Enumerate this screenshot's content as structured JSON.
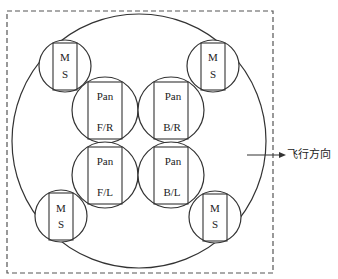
{
  "diagram": {
    "frame": {
      "x": 7,
      "y": 11,
      "width": 266,
      "height": 262,
      "style": "dashed"
    },
    "outer_circle": {
      "cx": 139,
      "cy": 141,
      "r": 127
    },
    "ms_units": [
      {
        "id": "ms-top-left",
        "cx": 65,
        "cy": 66,
        "r": 26,
        "rect": {
          "x": 53,
          "y": 43,
          "w": 24,
          "h": 47
        },
        "line1": "M",
        "line2": "S"
      },
      {
        "id": "ms-top-right",
        "cx": 213,
        "cy": 66,
        "r": 26,
        "rect": {
          "x": 201,
          "y": 43,
          "w": 24,
          "h": 47
        },
        "line1": "M",
        "line2": "S"
      },
      {
        "id": "ms-bottom-left",
        "cx": 61,
        "cy": 216,
        "r": 26,
        "rect": {
          "x": 49,
          "y": 193,
          "w": 24,
          "h": 47
        },
        "line1": "M",
        "line2": "S"
      },
      {
        "id": "ms-bottom-right",
        "cx": 215,
        "cy": 217,
        "r": 26,
        "rect": {
          "x": 203,
          "y": 194,
          "w": 24,
          "h": 47
        },
        "line1": "M",
        "line2": "S"
      }
    ],
    "pan_units": [
      {
        "id": "pan-fr",
        "cx": 105,
        "cy": 110,
        "r": 33,
        "rect": {
          "x": 88,
          "y": 82,
          "w": 34,
          "h": 57
        },
        "line1": "Pan",
        "line2": "F/R"
      },
      {
        "id": "pan-br",
        "cx": 171,
        "cy": 110,
        "r": 33,
        "rect": {
          "x": 154,
          "y": 82,
          "w": 34,
          "h": 57
        },
        "line1": "Pan",
        "line2": "B/R"
      },
      {
        "id": "pan-fl",
        "cx": 105,
        "cy": 175,
        "r": 33,
        "rect": {
          "x": 88,
          "y": 147,
          "w": 34,
          "h": 57
        },
        "line1": "Pan",
        "line2": "F/L"
      },
      {
        "id": "pan-bl",
        "cx": 171,
        "cy": 175,
        "r": 33,
        "rect": {
          "x": 154,
          "y": 147,
          "w": 34,
          "h": 57
        },
        "line1": "Pan",
        "line2": "B/L"
      }
    ],
    "direction_arrow": {
      "x1": 247,
      "y1": 155,
      "x2": 286,
      "y2": 155
    },
    "direction_label": "飞行方向",
    "colors": {
      "stroke": "#333333",
      "dashed": "#555555",
      "text": "#222222",
      "background": "#ffffff"
    }
  }
}
